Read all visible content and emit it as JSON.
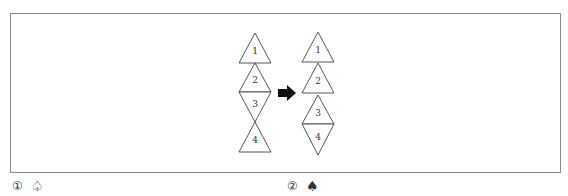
{
  "figure": {
    "left_stack": {
      "triangles": [
        {
          "label": "1",
          "direction": "up"
        },
        {
          "label": "2",
          "direction": "up"
        },
        {
          "label": "3",
          "direction": "down"
        },
        {
          "label": "4",
          "direction": "up"
        }
      ]
    },
    "arrow": "right-arrow",
    "right_stack": {
      "triangles": [
        {
          "label": "1",
          "direction": "up"
        },
        {
          "label": "2",
          "direction": "up"
        },
        {
          "label": "3",
          "direction": "up"
        },
        {
          "label": "4",
          "direction": "down"
        }
      ]
    }
  },
  "options": [
    {
      "number": "①",
      "symbol": "♤"
    },
    {
      "number": "②",
      "symbol": "♠"
    }
  ]
}
